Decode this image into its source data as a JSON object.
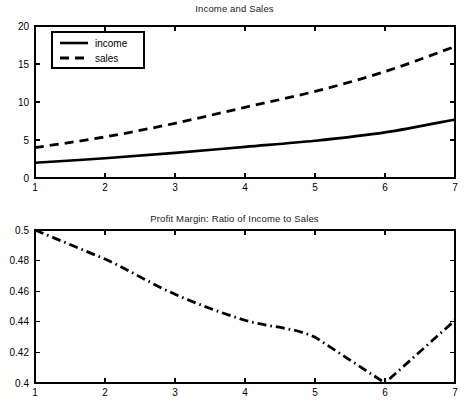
{
  "figure": {
    "background_color": "#ffffff",
    "foreground_color": "#000000",
    "panels": [
      "top",
      "bottom"
    ]
  },
  "top": {
    "title": "Income and Sales",
    "legend": {
      "position": "top-left-inside",
      "entries": [
        {
          "label": "income",
          "style": "solid"
        },
        {
          "label": "sales",
          "style": "dashed"
        }
      ]
    },
    "xticklabels": [
      "1",
      "2",
      "3",
      "4",
      "5",
      "6",
      "7"
    ],
    "yticklabels": [
      "0",
      "5",
      "10",
      "15",
      "20"
    ]
  },
  "bottom": {
    "title": "Profit Margin: Ratio of Income to Sales",
    "xticklabels": [
      "1",
      "2",
      "3",
      "4",
      "5",
      "6",
      "7"
    ],
    "yticklabels": [
      "0.4",
      "0.42",
      "0.44",
      "0.46",
      "0.48",
      "0.5"
    ]
  },
  "chart_data": [
    {
      "type": "line",
      "title": "Income and Sales",
      "xlabel": "",
      "ylabel": "",
      "x": [
        1,
        2,
        3,
        4,
        5,
        6,
        7
      ],
      "xlim": [
        1,
        7
      ],
      "ylim": [
        0,
        20
      ],
      "xticks": [
        1,
        2,
        3,
        4,
        5,
        6,
        7
      ],
      "yticks": [
        0,
        5,
        10,
        15,
        20
      ],
      "grid": false,
      "legend": [
        "income",
        "sales"
      ],
      "legend_position": "upper left",
      "series": [
        {
          "name": "income",
          "style": "solid",
          "color": "#000000",
          "values": [
            2.0,
            2.6,
            3.3,
            4.1,
            4.9,
            6.0,
            7.7
          ]
        },
        {
          "name": "sales",
          "style": "dashed",
          "color": "#000000",
          "values": [
            4.0,
            5.4,
            7.2,
            9.3,
            11.4,
            14.0,
            17.3
          ]
        }
      ]
    },
    {
      "type": "line",
      "title": "Profit Margin: Ratio of Income to Sales",
      "xlabel": "",
      "ylabel": "",
      "x": [
        1,
        2,
        3,
        4,
        5,
        6,
        7
      ],
      "xlim": [
        1,
        7
      ],
      "ylim": [
        0.4,
        0.5
      ],
      "xticks": [
        1,
        2,
        3,
        4,
        5,
        6,
        7
      ],
      "yticks": [
        0.4,
        0.42,
        0.44,
        0.46,
        0.48,
        0.5
      ],
      "grid": false,
      "legend": [],
      "series": [
        {
          "name": "profit margin",
          "style": "dash-dot",
          "color": "#000000",
          "values": [
            0.5,
            0.481,
            0.458,
            0.441,
            0.43,
            0.4,
            0.441
          ]
        }
      ]
    }
  ]
}
